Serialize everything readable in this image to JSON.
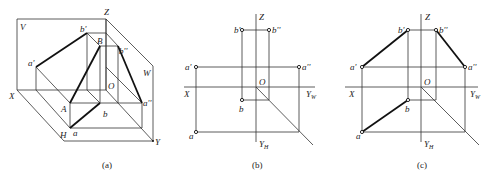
{
  "figure": {
    "panels": [
      {
        "caption": "(a)",
        "labels": {
          "V": "V",
          "Z": "Z",
          "W": "W",
          "X": "X",
          "O": "O",
          "H": "H",
          "Y": "Y",
          "a_prime": "a'",
          "b_prime": "b'",
          "B": "B",
          "b_dprime": "b''",
          "A": "A",
          "a": "a",
          "b": "b",
          "a_dprime": "a''"
        }
      },
      {
        "caption": "(b)",
        "labels": {
          "Z": "Z",
          "b_prime": "b'",
          "b_dprime": "b''",
          "a_prime": "a'",
          "a_dprime": "a''",
          "O": "O",
          "X": "X",
          "Y_W": "Y",
          "Y_W_sub": "W",
          "b": "b",
          "a": "a",
          "Y_H": "Y",
          "Y_H_sub": "H"
        }
      },
      {
        "caption": "(c)",
        "labels": {
          "Z": "Z",
          "b_prime": "b'",
          "b_dprime": "b''",
          "a_prime": "a'",
          "a_dprime": "a''",
          "O": "O",
          "X": "X",
          "Y_W": "Y",
          "Y_W_sub": "W",
          "b": "b",
          "a": "a",
          "Y_H": "Y",
          "Y_H_sub": "H"
        }
      }
    ]
  }
}
